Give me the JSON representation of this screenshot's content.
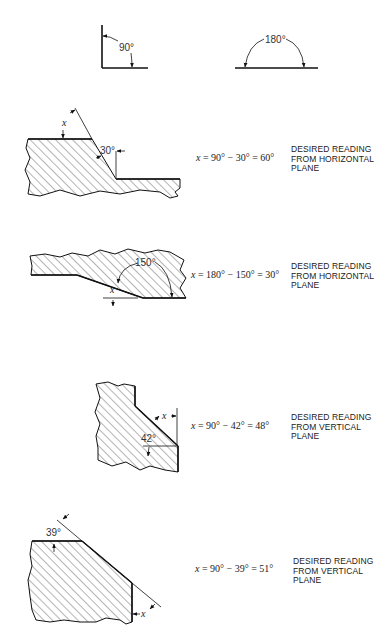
{
  "reference": {
    "right_angle_label": "90°",
    "straight_angle_label": "180°"
  },
  "examples": [
    {
      "id": "ex1",
      "angle_label": "30°",
      "x_label": "x",
      "equation": {
        "var": "x",
        "rest": " = 90° − 30° = 60°"
      },
      "note": [
        "DESIRED READING",
        "FROM HORIZONTAL",
        "PLANE"
      ]
    },
    {
      "id": "ex2",
      "angle_label": "150°",
      "x_label": "x",
      "equation": {
        "var": "x",
        "rest": " = 180° − 150° = 30°"
      },
      "note": [
        "DESIRED READING",
        "FROM HORIZONTAL",
        "PLANE"
      ]
    },
    {
      "id": "ex3",
      "angle_label": "42°",
      "x_label": "x",
      "equation": {
        "var": "x",
        "rest": " = 90° − 42° = 48°"
      },
      "note": [
        "DESIRED READING",
        "FROM VERTICAL",
        "PLANE"
      ]
    },
    {
      "id": "ex4",
      "angle_label": "39°",
      "x_label": "x",
      "equation": {
        "var": "x",
        "rest": " = 90° − 39° = 51°"
      },
      "note": [
        "DESIRED READING",
        "FROM VERTICAL",
        "PLANE"
      ]
    }
  ]
}
